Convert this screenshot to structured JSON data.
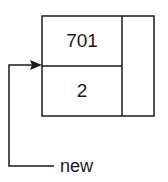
{
  "node": {
    "top_value": "701",
    "bottom_value": "2"
  },
  "pointer": {
    "label": "new"
  },
  "colors": {
    "stroke": "#1a1a1a",
    "background": "#ffffff"
  }
}
